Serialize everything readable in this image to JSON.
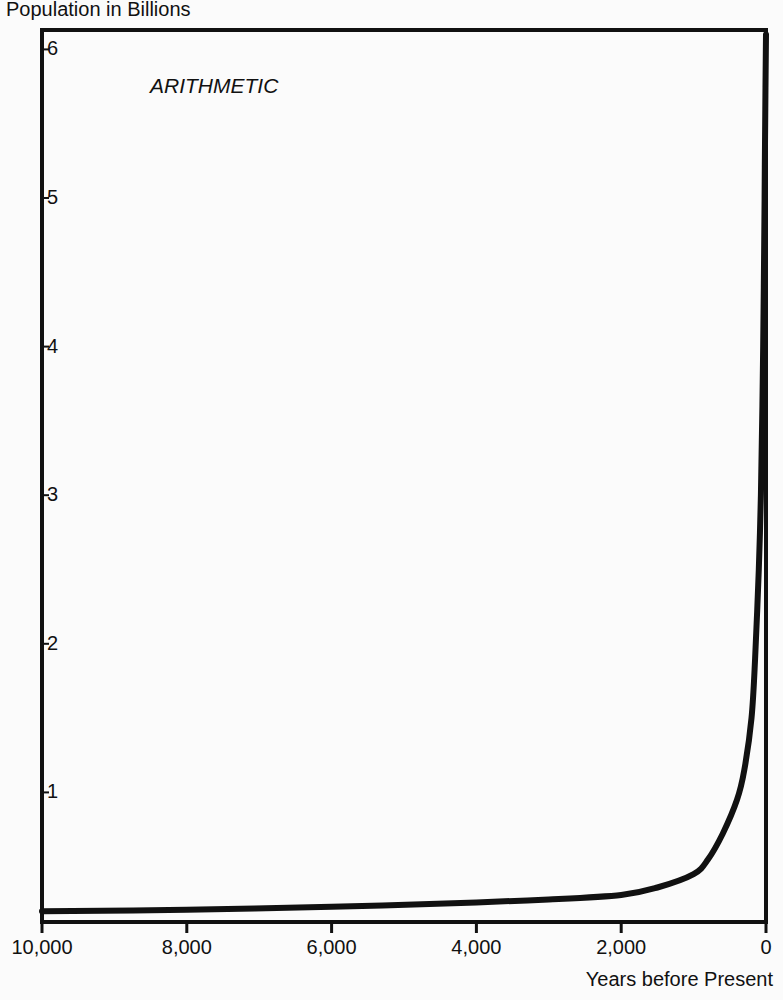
{
  "chart_data": {
    "type": "line",
    "title": "",
    "annotation": "ARITHMETIC",
    "ylabel": "Population in Billions",
    "xlabel": "Years before Present",
    "x_reversed": true,
    "xlim": [
      10000,
      0
    ],
    "ylim": [
      0.13,
      6.2
    ],
    "grid": false,
    "legend": null,
    "x_ticks": [
      "10,000",
      "8,000",
      "6,000",
      "4,000",
      "2,000",
      "0"
    ],
    "x_tick_values": [
      10000,
      8000,
      6000,
      4000,
      2000,
      0
    ],
    "y_ticks": [
      "1",
      "2",
      "3",
      "4",
      "5",
      "6"
    ],
    "y_tick_values": [
      1,
      2,
      3,
      4,
      5,
      6
    ],
    "series": [
      {
        "name": "World population",
        "color": "#111111",
        "x": [
          10000,
          8000,
          6000,
          4000,
          3000,
          2000,
          1500,
          1000,
          800,
          600,
          400,
          300,
          200,
          150,
          100,
          70,
          50,
          30,
          20,
          10,
          0
        ],
        "y": [
          0.2,
          0.21,
          0.23,
          0.26,
          0.28,
          0.31,
          0.36,
          0.45,
          0.55,
          0.72,
          0.95,
          1.15,
          1.5,
          1.9,
          2.5,
          3.0,
          3.6,
          4.4,
          5.0,
          5.6,
          6.1
        ]
      }
    ]
  },
  "colors": {
    "ink": "#111111",
    "background": "#fbfbfb"
  }
}
